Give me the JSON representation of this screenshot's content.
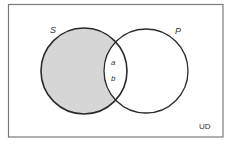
{
  "diagram": {
    "type": "venn",
    "universe": {
      "label": "UD",
      "rect": {
        "x": 8.5,
        "y": 4.5,
        "width": 214.5,
        "height": 132.5
      },
      "stroke": "#7a7a7a"
    },
    "circles": [
      {
        "id": "S",
        "label": "S",
        "cx": 84,
        "cy": 71,
        "r": 43,
        "shaded_region": "S only (outside P)"
      },
      {
        "id": "P",
        "label": "P",
        "cx": 146,
        "cy": 71,
        "r": 42
      }
    ],
    "region_labels": [
      {
        "text": "a",
        "region": "S ∩ P"
      },
      {
        "text": "b",
        "region": "S ∩ P"
      }
    ],
    "colors": {
      "shade": "#d6d6d6",
      "circle_stroke": "#2b2b2b",
      "background": "#ffffff"
    }
  }
}
